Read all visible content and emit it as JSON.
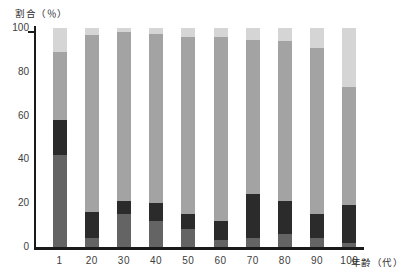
{
  "titles": {
    "y_axis": "割合（％）",
    "x_axis": "年齢（代）"
  },
  "chart_data": {
    "type": "bar",
    "subtype": "stacked-100-percent",
    "title": "",
    "ylabel": "割合（％）",
    "xlabel": "年齢（代）",
    "ylim": [
      0,
      100
    ],
    "yticks": [
      0,
      20,
      40,
      60,
      80,
      100
    ],
    "grid": false,
    "legend": "none",
    "categories": [
      "1",
      "20",
      "30",
      "40",
      "50",
      "60",
      "70",
      "80",
      "90",
      "100"
    ],
    "series": [
      {
        "name": "dark-gray-bottom-segment",
        "color": "#646464",
        "values": [
          42,
          4,
          15,
          12,
          8,
          3,
          4,
          6,
          4,
          2
        ]
      },
      {
        "name": "black-segment",
        "color": "#2b2b2b",
        "values": [
          16,
          12,
          6,
          8,
          7,
          9,
          20,
          15,
          11,
          17
        ]
      },
      {
        "name": "medium-gray-segment",
        "color": "#a3a3a3",
        "values": [
          31,
          81,
          77,
          77.5,
          81,
          84,
          70.5,
          73,
          76,
          54
        ]
      },
      {
        "name": "light-gray-top-segment",
        "color": "#d5d5d5",
        "values": [
          11,
          3,
          2,
          2.5,
          4,
          4,
          5.5,
          6,
          9,
          27
        ]
      }
    ],
    "colors": {
      "axis": "#1a1a1a",
      "tick_label": "#3d3d3d",
      "background": "#ffffff"
    }
  }
}
